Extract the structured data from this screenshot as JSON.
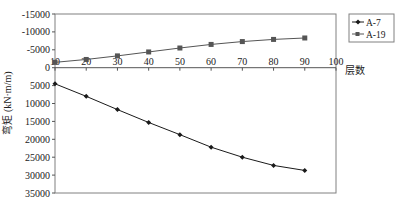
{
  "chart_data": {
    "type": "line",
    "title": "",
    "xlabel": "层数",
    "ylabel": "弯矩 (kN·m/m)",
    "xlim": [
      10,
      100
    ],
    "ylim": [
      -15000,
      35000
    ],
    "y_inverted": true,
    "x_ticks": [
      "10",
      "20",
      "30",
      "40",
      "50",
      "60",
      "70",
      "80",
      "90",
      "100"
    ],
    "y_ticks": [
      "-15000",
      "-10000",
      "-5000",
      "0",
      "5000",
      "10000",
      "15000",
      "20000",
      "25000",
      "30000",
      "35000"
    ],
    "x": [
      10,
      20,
      30,
      40,
      50,
      60,
      70,
      80,
      90
    ],
    "series": [
      {
        "name": "A-7",
        "marker": "diamond",
        "color": "#1a1a1a",
        "values": [
          4500,
          8000,
          11700,
          15300,
          18700,
          22200,
          25000,
          27300,
          28700
        ]
      },
      {
        "name": "A-19",
        "marker": "square",
        "color": "#555555",
        "values": [
          -1500,
          -2300,
          -3300,
          -4400,
          -5500,
          -6500,
          -7300,
          -7900,
          -8300
        ]
      }
    ],
    "grid": false,
    "legend_position": "top-right-outside"
  }
}
